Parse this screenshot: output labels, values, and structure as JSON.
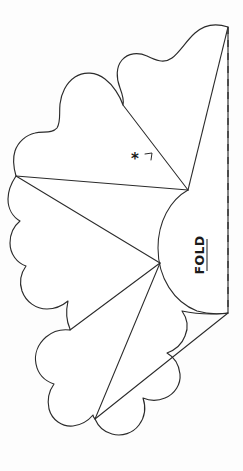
{
  "document": {
    "title": "Folded Flower Petal Cutting Pattern",
    "type": "craft-fold-pattern-diagram",
    "background_color": "#fdfdfd",
    "ink_color": "#2b2b2b",
    "width": 243,
    "height": 471
  },
  "labels": {
    "fold": {
      "text": "FOLD",
      "orientation": "rotated-vertical",
      "position": "right-center, beside dashed line"
    },
    "asterisk": {
      "text": "*",
      "meaning": "reference-mark",
      "position": "upper-right petal interior"
    }
  },
  "geometry": {
    "fold_line": {
      "style": "dashed",
      "x": 228,
      "y_start": 27,
      "y_end": 313,
      "dash_pattern": "7 6",
      "color": "#3a3a3a"
    },
    "vertices": {
      "top_fold_point": [
        228,
        27
      ],
      "upper_hub": [
        188,
        190
      ],
      "center_hub": [
        160,
        263
      ],
      "left_point": [
        16,
        176
      ],
      "bottom_point": [
        95,
        419
      ],
      "bottom_fold_point": [
        228,
        313
      ]
    },
    "crease_lines": [
      {
        "name": "top-fold-to-upper-hub",
        "from": [
          228,
          27
        ],
        "to": [
          188,
          190
        ]
      },
      {
        "name": "upper-hub-to-notch",
        "from": [
          188,
          190
        ],
        "to": [
          123,
          105
        ]
      },
      {
        "name": "upper-hub-to-left-point",
        "from": [
          188,
          190
        ],
        "to": [
          16,
          176
        ]
      },
      {
        "name": "left-point-to-center-hub",
        "from": [
          16,
          176
        ],
        "to": [
          160,
          263
        ]
      },
      {
        "name": "center-hub-to-lower-left",
        "from": [
          160,
          263
        ],
        "to": [
          70,
          330
        ]
      },
      {
        "name": "center-hub-to-bottom-point",
        "from": [
          160,
          263
        ],
        "to": [
          95,
          419
        ]
      },
      {
        "name": "bottom-point-to-bottom-fold",
        "from": [
          95,
          419
        ],
        "to": [
          228,
          313
        ]
      }
    ],
    "outline": {
      "description": "scalloped multi-petal flower silhouette with semicircular bulge on right side against the fold line",
      "petal_count": 4,
      "right_bulge": {
        "type": "semicircle",
        "from": [
          188,
          190
        ],
        "to": [
          228,
          313
        ]
      }
    }
  }
}
